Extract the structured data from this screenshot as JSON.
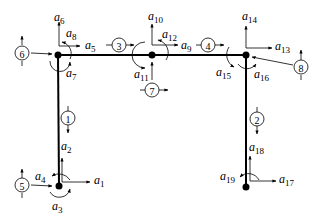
{
  "diagram": {
    "type": "portal frame degrees-of-freedom diagram",
    "joints": [
      {
        "id": "bottom-left",
        "x": 59,
        "y": 186
      },
      {
        "id": "top-left",
        "x": 58,
        "y": 55
      },
      {
        "id": "top-middle",
        "x": 152,
        "y": 55
      },
      {
        "id": "top-right",
        "x": 246,
        "y": 55
      },
      {
        "id": "bottom-right",
        "x": 246,
        "y": 187
      }
    ],
    "element_numbers": [
      "1",
      "2",
      "3",
      "4",
      "5",
      "6",
      "7",
      "8"
    ],
    "dof_labels": {
      "a1": {
        "base": "a",
        "sub": "1"
      },
      "a2": {
        "base": "a",
        "sub": "2"
      },
      "a3": {
        "base": "a",
        "sub": "3"
      },
      "a4": {
        "base": "a",
        "sub": "4"
      },
      "a5": {
        "base": "a",
        "sub": "5"
      },
      "a6": {
        "base": "a",
        "sub": "6"
      },
      "a7": {
        "base": "a",
        "sub": "7"
      },
      "a8": {
        "base": "a",
        "sub": "8"
      },
      "a9": {
        "base": "a",
        "sub": "9"
      },
      "a10": {
        "base": "a",
        "sub": "10"
      },
      "a11": {
        "base": "a",
        "sub": "11"
      },
      "a12": {
        "base": "a",
        "sub": "12"
      },
      "a13": {
        "base": "a",
        "sub": "13"
      },
      "a14": {
        "base": "a",
        "sub": "14"
      },
      "a15": {
        "base": "a",
        "sub": "15"
      },
      "a16": {
        "base": "a",
        "sub": "16"
      },
      "a17": {
        "base": "a",
        "sub": "17"
      },
      "a18": {
        "base": "a",
        "sub": "18"
      },
      "a19": {
        "base": "a",
        "sub": "19"
      }
    }
  }
}
